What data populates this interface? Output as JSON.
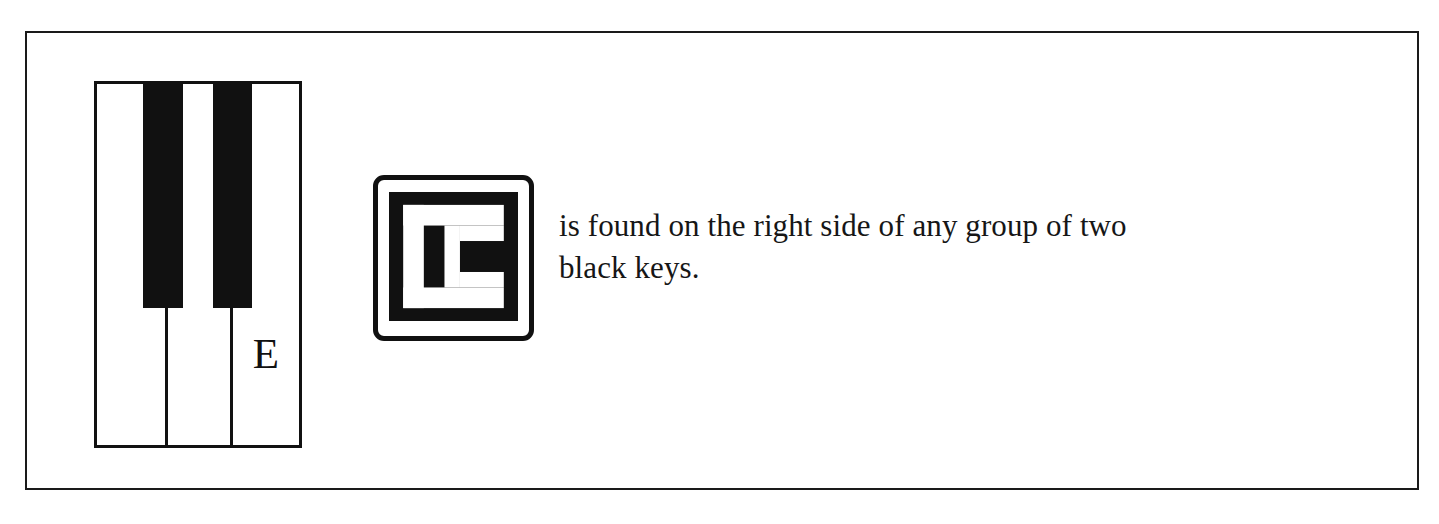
{
  "figure": {
    "type": "piano-keyboard-note-diagram",
    "note": "E",
    "caption": "is found on the right side of any group of two black keys.",
    "colors": {
      "ink": "#111111",
      "paper": "#ffffff",
      "frame_border": "#1a1a1a"
    }
  },
  "keyboard": {
    "note_label": "E",
    "white_key_count": 3,
    "black_key_count": 2,
    "labeled_key_index": 3,
    "icons": {
      "white_key": "white-piano-key-icon",
      "black_key": "black-piano-key-icon"
    }
  },
  "note_icon": {
    "letter": "E",
    "icon_name": "boxed-letter-e-icon",
    "style": "reversed-knockout-serif-capital",
    "corner_radius_px": 11
  }
}
